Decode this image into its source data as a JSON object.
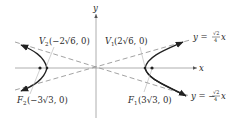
{
  "diagram": {
    "type": "hyperbola",
    "colors": {
      "axis": "#9a9a9a",
      "curve": "#222222",
      "asymptote": "#8a8a8a",
      "text": "#2a2a2a",
      "leader": "#b0b0b0"
    },
    "axes": {
      "x_label": "x",
      "y_label": "y"
    },
    "asymptotes": {
      "upper": {
        "prefix": "y = ",
        "num": "√2",
        "den": "4",
        "suffix": "x"
      },
      "lower": {
        "prefix": "y = −",
        "num": "√2",
        "den": "4",
        "suffix": "x"
      }
    },
    "points": {
      "v1": {
        "name": "V",
        "sub": "1",
        "coords": "(2√6, 0)"
      },
      "v2": {
        "name": "V",
        "sub": "2",
        "coords": "(−2√6, 0)"
      },
      "f1": {
        "name": "F",
        "sub": "1",
        "coords": "(3√3, 0)"
      },
      "f2": {
        "name": "F",
        "sub": "2",
        "coords": "(−3√3, 0)"
      }
    }
  }
}
